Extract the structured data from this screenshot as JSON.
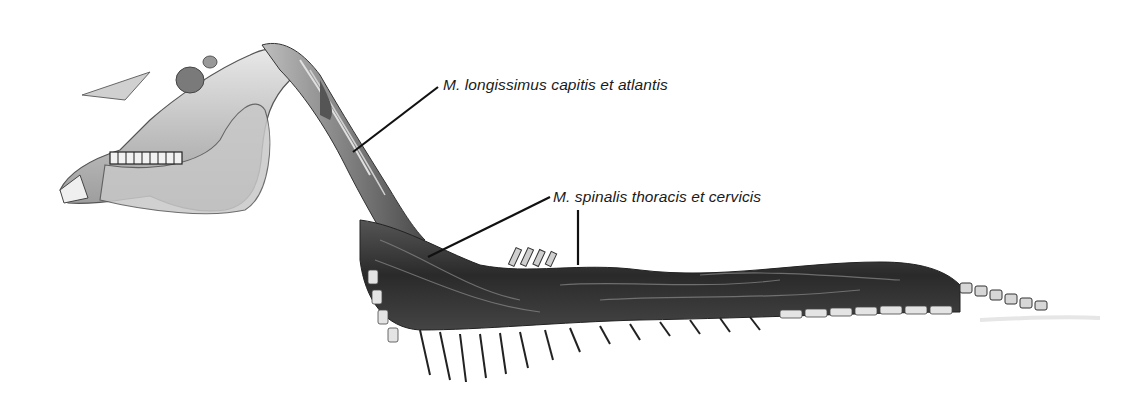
{
  "figure": {
    "background": "#ffffff"
  },
  "labels": [
    {
      "id": "longissimus",
      "text": "M. longissimus capitis et atlantis",
      "x": 443,
      "y": 76
    },
    {
      "id": "spinalis",
      "text": "M. spinalis thoracis et cervicis",
      "x": 553,
      "y": 188
    }
  ],
  "leader_lines": [
    {
      "label": "longissimus",
      "from": [
        438,
        87
      ],
      "to": [
        353,
        152
      ]
    },
    {
      "label": "spinalis",
      "from": [
        550,
        197
      ],
      "to": [
        428,
        257
      ]
    },
    {
      "label": "spinalis",
      "from": [
        578,
        210
      ],
      "to": [
        578,
        265
      ]
    }
  ],
  "colors": {
    "ink": "#111111",
    "bone": "#d9d9d9",
    "muscle_dark": "#2b2b2b",
    "muscle_mid": "#6a6a6a",
    "label_text": "#1a1a1a"
  }
}
